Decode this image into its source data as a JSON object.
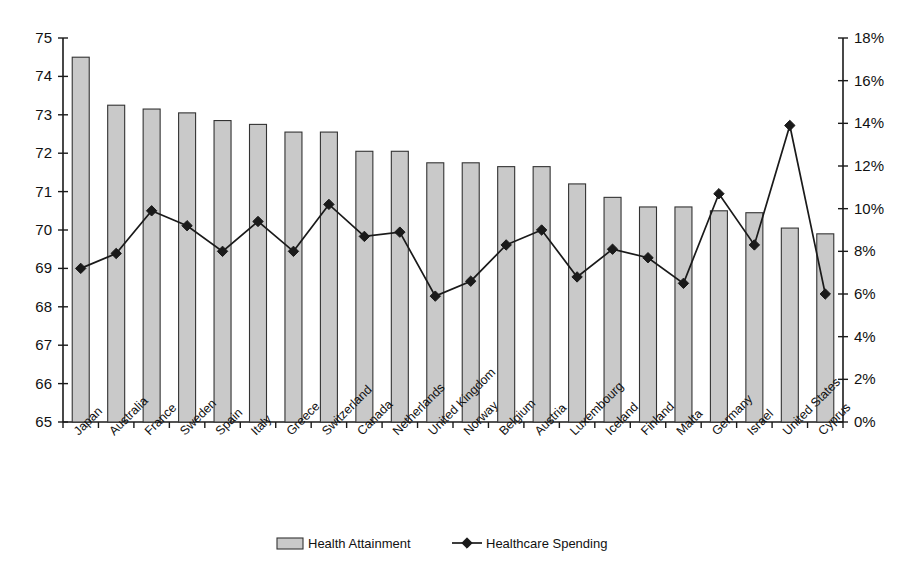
{
  "chart_data": {
    "type": "bar",
    "title": "",
    "xlabel": "",
    "ylabel": "",
    "grid": false,
    "legend_position": "bottom",
    "categories": [
      "Japan",
      "Australia",
      "France",
      "Sweden",
      "Spain",
      "Italy",
      "Greece",
      "Switzerland",
      "Canada",
      "Netherlands",
      "United Kingdom",
      "Norway",
      "Belgium",
      "Austria",
      "Luxembourg",
      "Iceland",
      "Finland",
      "Malta",
      "Germany",
      "Israel",
      "United States",
      "Cyprus"
    ],
    "series": [
      {
        "name": "Health Attainment",
        "type": "bar",
        "axis": "left",
        "values": [
          74.5,
          73.25,
          73.15,
          73.05,
          72.85,
          72.75,
          72.55,
          72.55,
          72.05,
          72.05,
          71.75,
          71.75,
          71.65,
          71.65,
          71.2,
          70.85,
          70.6,
          70.6,
          70.5,
          70.45,
          70.05,
          69.9
        ]
      },
      {
        "name": "Healthcare Spending",
        "type": "line",
        "axis": "right",
        "values": [
          7.2,
          7.9,
          9.9,
          9.2,
          8.0,
          9.4,
          8.0,
          10.2,
          8.7,
          8.9,
          5.9,
          6.6,
          8.3,
          9.0,
          6.8,
          8.1,
          7.7,
          6.5,
          10.7,
          8.3,
          13.9,
          6.0
        ]
      }
    ],
    "left_axis": {
      "min": 65,
      "max": 75,
      "step": 1,
      "ticks": [
        "65",
        "66",
        "67",
        "68",
        "69",
        "70",
        "71",
        "72",
        "73",
        "74",
        "75"
      ]
    },
    "right_axis": {
      "min": 0,
      "max": 18,
      "step": 2,
      "ticks": [
        "0%",
        "2%",
        "4%",
        "6%",
        "8%",
        "10%",
        "12%",
        "14%",
        "16%",
        "18%"
      ]
    },
    "colors": {
      "bar_fill": "#c9c9c9",
      "bar_stroke": "#333333",
      "line": "#1a1a1a",
      "axis": "#1a1a1a",
      "background": "#ffffff"
    }
  },
  "legend": {
    "items": [
      {
        "label": "Health Attainment",
        "marker": "bar-swatch"
      },
      {
        "label": "Healthcare Spending",
        "marker": "line-diamond-marker"
      }
    ]
  }
}
